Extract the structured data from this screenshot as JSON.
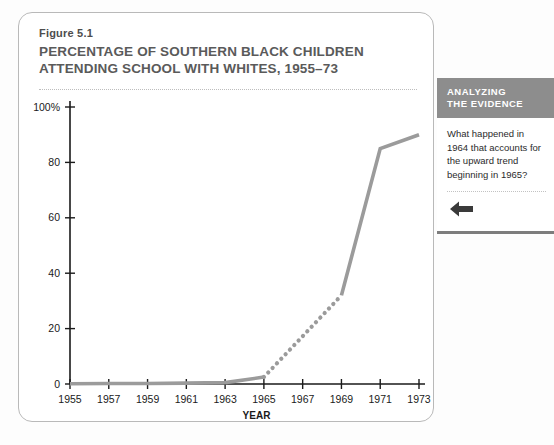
{
  "figure": {
    "label": "Figure 5.1",
    "title": "PERCENTAGE OF SOUTHERN BLACK CHILDREN ATTENDING SCHOOL WITH WHITES, 1955–73"
  },
  "sidebar": {
    "heading_line1": "ANALYZING",
    "heading_line2": "THE EVIDENCE",
    "question": "What happened in 1964 that accounts for the upward trend beginning in 1965?",
    "arrow_icon": "arrow-left-icon",
    "header_bg": "#8d8d8d",
    "header_text_color": "#ffffff"
  },
  "chart_data": {
    "type": "line",
    "title": "PERCENTAGE OF SOUTHERN BLACK CHILDREN ATTENDING SCHOOL WITH WHITES, 1955–73",
    "xlabel": "YEAR",
    "ylabel": "",
    "xlim": [
      1955,
      1973
    ],
    "ylim": [
      0,
      100
    ],
    "grid": false,
    "legend": null,
    "line_color": "#9b9b9b",
    "axis_color": "#1a1a1a",
    "xticks": [
      1955,
      1957,
      1959,
      1961,
      1963,
      1965,
      1967,
      1969,
      1971,
      1973
    ],
    "xtick_labels": [
      "1955",
      "1957",
      "1959",
      "1961",
      "1963",
      "1965",
      "1967",
      "1969",
      "1971",
      "1973"
    ],
    "yticks": [
      0,
      20,
      40,
      60,
      80,
      100
    ],
    "ytick_labels": [
      "0",
      "20",
      "40",
      "60",
      "80",
      "100%"
    ],
    "series": [
      {
        "name": "Percentage of southern black children attending school with whites",
        "style": "solid",
        "x": [
          1955,
          1957,
          1959,
          1961,
          1963,
          1965
        ],
        "values": [
          0.1,
          0.2,
          0.2,
          0.3,
          0.5,
          2.5
        ]
      },
      {
        "name": "Interpolated segment",
        "style": "dotted",
        "x": [
          1965,
          1969
        ],
        "values": [
          2.5,
          32
        ]
      },
      {
        "name": "Percentage of southern black children attending school with whites",
        "style": "solid",
        "x": [
          1969,
          1971,
          1973
        ],
        "values": [
          32,
          85,
          90
        ]
      }
    ]
  }
}
